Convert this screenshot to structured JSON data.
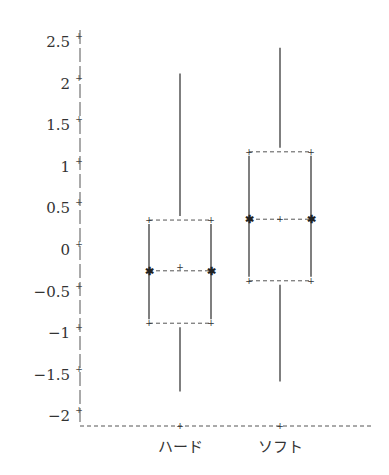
{
  "chart_data": {
    "type": "box",
    "title": "",
    "xlabel": "",
    "ylabel": "",
    "categories": [
      "ハード",
      "ソフト"
    ],
    "yticks": [
      2.5,
      2,
      1.5,
      1,
      0.5,
      0,
      -0.5,
      -1,
      -1.5,
      -2
    ],
    "ytick_labels": [
      "2.5",
      "2",
      "1.5",
      "1",
      "0.5",
      "0",
      "−0.5",
      "−1",
      "−1.5",
      "−2"
    ],
    "ylim": [
      -2.12,
      2.6
    ],
    "grid": false,
    "legend": null,
    "series": [
      {
        "name": "ハード",
        "whisker_high": 2.12,
        "q3": 0.36,
        "median": -0.25,
        "mean": -0.2,
        "q1": -0.88,
        "whisker_low": -1.7
      },
      {
        "name": "ソフト",
        "whisker_high": 2.43,
        "q3": 1.18,
        "median": 0.37,
        "mean": 0.37,
        "q1": -0.37,
        "whisker_low": -1.58
      }
    ]
  }
}
